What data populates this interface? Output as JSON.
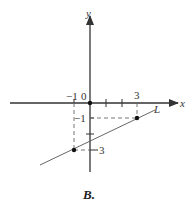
{
  "figure": {
    "caption": "B.",
    "axes": {
      "x_label": "x",
      "y_label": "y",
      "origin_label": "0"
    },
    "tick_labels": {
      "x_neg1": "−1",
      "x_3": "3",
      "y_neg1": "−1",
      "y_neg3": "3"
    },
    "line": {
      "label": "L",
      "points": [
        {
          "x": -1,
          "y": -3
        },
        {
          "x": 3,
          "y": -1
        }
      ]
    },
    "colors": {
      "axis": "#333333",
      "line": "#555555",
      "dashed": "#666666"
    }
  }
}
